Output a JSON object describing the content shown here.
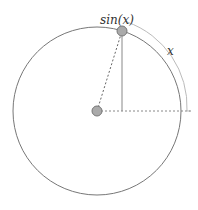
{
  "diagram": {
    "title_label": "sin(x)",
    "arc_label": "x",
    "colors": {
      "circle": "#777777",
      "arc": "#bbbbbb",
      "point_fill": "#aaaaaa",
      "point_stroke": "#777777",
      "line": "#888888"
    },
    "geometry": {
      "center": [
        97,
        111
      ],
      "radius": 84,
      "point": [
        122,
        31
      ]
    }
  }
}
